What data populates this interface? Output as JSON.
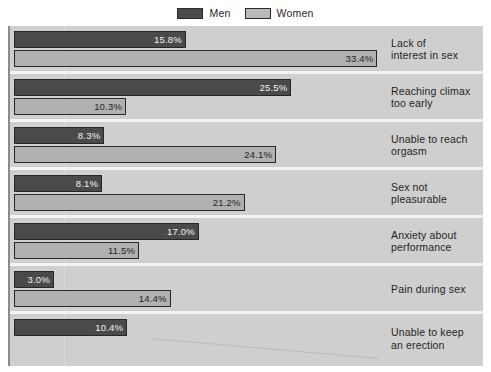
{
  "legend": {
    "items": [
      {
        "label": "Men",
        "color": "#4a4a4a",
        "icon": "legend-swatch-men"
      },
      {
        "label": "Women",
        "color": "#b0b0b0",
        "icon": "legend-swatch-women"
      }
    ]
  },
  "chart_data": {
    "type": "bar",
    "orientation": "horizontal",
    "title": "",
    "subtitle": "",
    "xlabel": "",
    "ylabel": "",
    "grid": true,
    "legend_position": "top-center",
    "value_format": "percent",
    "xlim": [
      0,
      35
    ],
    "categories": [
      "Lack of interest in sex",
      "Reaching climax too early",
      "Unable to reach orgasm",
      "Sex not pleasurable",
      "Anxiety about performance",
      "Pain during sex",
      "Unable to keep an erection"
    ],
    "series": [
      {
        "name": "Men",
        "color": "#4a4a4a",
        "values": [
          15.8,
          25.5,
          8.3,
          8.1,
          17.0,
          3.0,
          10.4
        ],
        "labels": [
          "15.8%",
          "25.5%",
          "8.3%",
          "8.1%",
          "17.0%",
          "3.0%",
          "10.4%"
        ]
      },
      {
        "name": "Women",
        "color": "#b0b0b0",
        "values": [
          33.4,
          10.3,
          24.1,
          21.2,
          11.5,
          14.4,
          null
        ],
        "labels": [
          "33.4%",
          "10.3%",
          "24.1%",
          "21.2%",
          "11.5%",
          "14.4%",
          ""
        ]
      }
    ]
  },
  "rows": [
    {
      "category_line1": "Lack of",
      "category_line2": "interest in sex",
      "men": {
        "label": "15.8%",
        "value": 15.8
      },
      "women": {
        "label": "33.4%",
        "value": 33.4
      }
    },
    {
      "category_line1": "Reaching climax",
      "category_line2": "too early",
      "men": {
        "label": "25.5%",
        "value": 25.5
      },
      "women": {
        "label": "10.3%",
        "value": 10.3
      }
    },
    {
      "category_line1": "Unable to reach",
      "category_line2": "orgasm",
      "men": {
        "label": "8.3%",
        "value": 8.3
      },
      "women": {
        "label": "24.1%",
        "value": 24.1
      }
    },
    {
      "category_line1": "Sex not",
      "category_line2": "pleasurable",
      "men": {
        "label": "8.1%",
        "value": 8.1
      },
      "women": {
        "label": "21.2%",
        "value": 21.2
      }
    },
    {
      "category_line1": "Anxiety about",
      "category_line2": "performance",
      "men": {
        "label": "17.0%",
        "value": 17.0
      },
      "women": {
        "label": "11.5%",
        "value": 11.5
      }
    },
    {
      "category_line1": "Pain during sex",
      "category_line2": "",
      "men": {
        "label": "3.0%",
        "value": 3.0
      },
      "women": {
        "label": "14.4%",
        "value": 14.4
      }
    },
    {
      "category_line1": "Unable to keep",
      "category_line2": "an erection",
      "men": {
        "label": "10.4%",
        "value": 10.4
      },
      "women": {
        "label": "",
        "value": null
      }
    }
  ],
  "colors": {
    "men_bar": "#4a4a4a",
    "women_bar": "#b0b0b0",
    "plot_background": "#cfcfcf",
    "row_separator": "#f2f2f2",
    "bar_outline": "#262626",
    "page_background": "#ffffff"
  }
}
